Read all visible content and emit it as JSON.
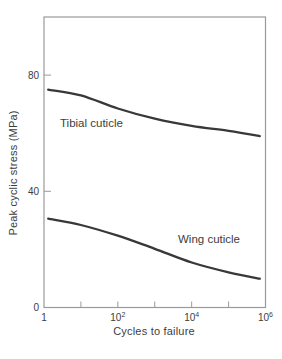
{
  "chart_data": {
    "type": "line",
    "title": "",
    "xlabel": "Cycles to failure",
    "ylabel": "Peak cyclic stress (MPa)",
    "x_scale": "log",
    "xlim": [
      1,
      1000000
    ],
    "ylim": [
      0,
      100
    ],
    "grid": false,
    "legend_position": "inline-labels",
    "x_ticks": [
      {
        "value": 1,
        "base": "1",
        "exp": ""
      },
      {
        "value": 100,
        "base": "10",
        "exp": "2"
      },
      {
        "value": 10000,
        "base": "10",
        "exp": "4"
      },
      {
        "value": 1000000,
        "base": "10",
        "exp": "6"
      }
    ],
    "x_minor_ticks": [
      10,
      100,
      1000,
      10000,
      100000
    ],
    "y_ticks": [
      {
        "value": 0,
        "label": "0"
      },
      {
        "value": 40,
        "label": "40"
      },
      {
        "value": 80,
        "label": "80"
      }
    ],
    "series": [
      {
        "name": "Tibial cuticle",
        "points": [
          [
            1.3,
            75
          ],
          [
            10,
            73
          ],
          [
            100,
            68.5
          ],
          [
            1000,
            65
          ],
          [
            10000,
            62.5
          ],
          [
            100000,
            60.8
          ],
          [
            700000,
            59
          ]
        ]
      },
      {
        "name": "Wing cuticle",
        "points": [
          [
            1.3,
            30.6
          ],
          [
            10,
            28.4
          ],
          [
            100,
            24.7
          ],
          [
            1000,
            20.2
          ],
          [
            10000,
            15.5
          ],
          [
            100000,
            12.1
          ],
          [
            700000,
            9.9
          ]
        ]
      }
    ],
    "colors": {
      "curve": "#383838",
      "axis": "#9a9a9a",
      "text": "#3d3d3d",
      "background": "#ffffff"
    }
  }
}
